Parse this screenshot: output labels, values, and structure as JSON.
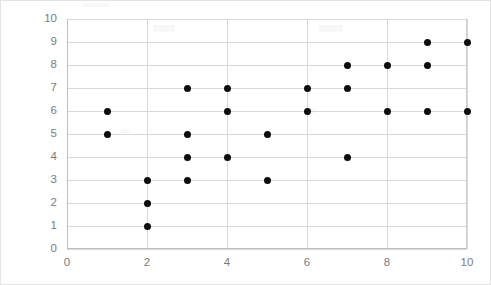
{
  "chart_data": {
    "type": "scatter",
    "title": "",
    "subtitle": "",
    "xlabel": "",
    "ylabel": "",
    "xlim": [
      0,
      10
    ],
    "ylim": [
      0,
      10
    ],
    "grid": true,
    "legend": false,
    "legend_position": "none",
    "marker": {
      "shape": "circle",
      "color": "#0d0d0d",
      "size_px": 7
    },
    "axes": {
      "x_ticks": [
        0,
        2,
        4,
        6,
        8,
        10
      ],
      "x_tick_labels": [
        "0",
        "2",
        "4",
        "6",
        "8",
        "10"
      ],
      "x_gridlines": [
        0,
        2,
        4,
        6,
        8,
        10
      ],
      "y_ticks": [
        0,
        1,
        2,
        3,
        4,
        5,
        6,
        7,
        8,
        9,
        10
      ],
      "y_tick_labels": [
        "0",
        "1",
        "2",
        "3",
        "4",
        "5",
        "6",
        "7",
        "8",
        "9",
        "10"
      ],
      "y_gridlines": [
        0,
        1,
        2,
        3,
        4,
        5,
        6,
        7,
        8,
        9,
        10
      ],
      "tick_label_color": "#7b7b7b",
      "gridline_color": "#d8d8d8",
      "axis_line_color": "#bdbdbd"
    },
    "point_count": 26,
    "points": [
      {
        "x": 1,
        "y": 6
      },
      {
        "x": 1,
        "y": 5
      },
      {
        "x": 2,
        "y": 3
      },
      {
        "x": 2,
        "y": 2
      },
      {
        "x": 2,
        "y": 1
      },
      {
        "x": 3,
        "y": 7
      },
      {
        "x": 3,
        "y": 5
      },
      {
        "x": 3,
        "y": 4
      },
      {
        "x": 3,
        "y": 3
      },
      {
        "x": 4,
        "y": 7
      },
      {
        "x": 4,
        "y": 6
      },
      {
        "x": 4,
        "y": 4
      },
      {
        "x": 5,
        "y": 5
      },
      {
        "x": 5,
        "y": 3
      },
      {
        "x": 6,
        "y": 7
      },
      {
        "x": 6,
        "y": 6
      },
      {
        "x": 7,
        "y": 8
      },
      {
        "x": 7,
        "y": 7
      },
      {
        "x": 7,
        "y": 4
      },
      {
        "x": 8,
        "y": 8
      },
      {
        "x": 8,
        "y": 6
      },
      {
        "x": 9,
        "y": 9
      },
      {
        "x": 9,
        "y": 8
      },
      {
        "x": 9,
        "y": 6
      },
      {
        "x": 10,
        "y": 9
      },
      {
        "x": 10,
        "y": 6
      }
    ]
  },
  "frame": {
    "background_color": "#ffffff",
    "border_color": "#e2e2e2"
  }
}
